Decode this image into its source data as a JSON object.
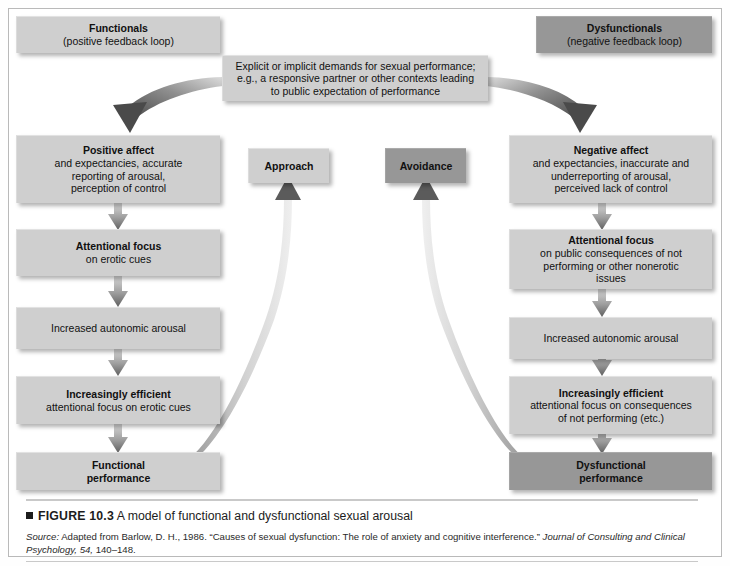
{
  "figure": {
    "marker": "■",
    "label": "FIGURE 10.3",
    "title": " A model of functional and dysfunctional sexual arousal",
    "source_prefix": "Source:",
    "source_part1": " Adapted from Barlow, D. H., 1986. “Causes of sexual dysfunction: The role of anxiety and cognitive interference.” ",
    "source_journal": "Journal of Consulting and Clinical Psychology, 54,",
    "source_pages": " 140–148."
  },
  "headers": {
    "left_title": "Functionals",
    "left_sub": "(positive feedback loop)",
    "right_title": "Dysfunctionals",
    "right_sub": "(negative feedback loop)"
  },
  "top_box": {
    "line1": "Explicit or implicit demands for sexual performance;",
    "line2": "e.g., a responsive partner or other contexts leading",
    "line3": "to public expectation of performance"
  },
  "left_chain": {
    "affect_title": "Positive affect",
    "affect_l1": "and expectancies, accurate",
    "affect_l2": "reporting of arousal,",
    "affect_l3": "perception of control",
    "focus_title": "Attentional focus",
    "focus_l1": "on erotic cues",
    "arousal": "Increased autonomic arousal",
    "efficient_title": "Increasingly efficient",
    "efficient_l1": "attentional focus on erotic cues",
    "outcome_l1": "Functional",
    "outcome_l2": "performance"
  },
  "right_chain": {
    "affect_title": "Negative affect",
    "affect_l1": "and expectancies, inaccurate and",
    "affect_l2": "underreporting of arousal,",
    "affect_l3": "perceived lack of control",
    "focus_title": "Attentional focus",
    "focus_l1": "on public consequences of not",
    "focus_l2": "performing or other nonerotic",
    "focus_l3": "issues",
    "arousal": "Increased autonomic arousal",
    "efficient_title": "Increasingly efficient",
    "efficient_l1": "attentional focus on consequences",
    "efficient_l2": "of not performing (etc.)",
    "outcome_l1": "Dysfunctional",
    "outcome_l2": "performance"
  },
  "middle": {
    "approach": "Approach",
    "avoidance": "Avoidance"
  },
  "colors": {
    "box_light": "#cfcfcf",
    "box_dark": "#979797",
    "arrow_dark": "#6b6b6b",
    "arrow_light": "#cfcfcf",
    "frame": "#b9b9b9",
    "text": "#111111"
  }
}
